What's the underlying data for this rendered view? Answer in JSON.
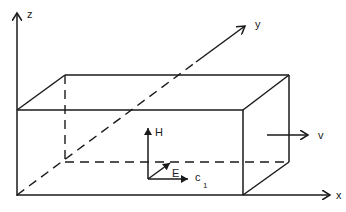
{
  "diagram": {
    "axes": {
      "x": {
        "label": "x"
      },
      "y": {
        "label": "y"
      },
      "z": {
        "label": "z"
      }
    },
    "velocity": {
      "label": "v"
    },
    "vectors": {
      "H": {
        "label": "H"
      },
      "E": {
        "label": "E"
      },
      "c": {
        "label": "c",
        "subscript": "1"
      }
    },
    "colors": {
      "stroke": "#1a1a1a",
      "background": "#ffffff"
    }
  }
}
